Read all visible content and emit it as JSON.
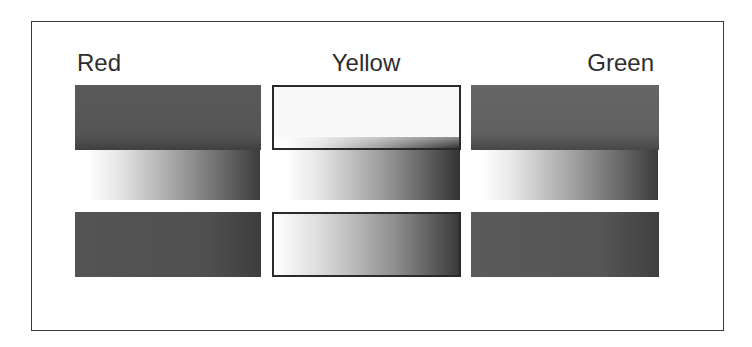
{
  "diagram": {
    "columns": [
      {
        "label": "Red",
        "top_box": {
          "tone": "#555555",
          "style": "solid-dark"
        },
        "gradient_band": {
          "from": "#ffffff",
          "to": "#3c3c3c",
          "direction": "left-to-right"
        },
        "bottom_box": {
          "tone": "#505050",
          "style": "solid-dark"
        }
      },
      {
        "label": "Yellow",
        "top_box": {
          "tone": "#f8f8f8",
          "style": "light-bordered"
        },
        "gradient_band": {
          "from": "#ffffff",
          "to": "#333333",
          "direction": "left-to-right"
        },
        "bottom_box": {
          "from": "#ffffff",
          "to": "#3a3a3a",
          "style": "gradient-bordered"
        }
      },
      {
        "label": "Green",
        "top_box": {
          "tone": "#606060",
          "style": "solid-dark"
        },
        "gradient_band": {
          "from": "#ffffff",
          "to": "#3b3b3b",
          "direction": "left-to-right"
        },
        "bottom_box": {
          "tone": "#555555",
          "style": "solid-dark"
        }
      }
    ],
    "frame_color": "#3a3a3a",
    "label_color": "#2e2e2e"
  }
}
